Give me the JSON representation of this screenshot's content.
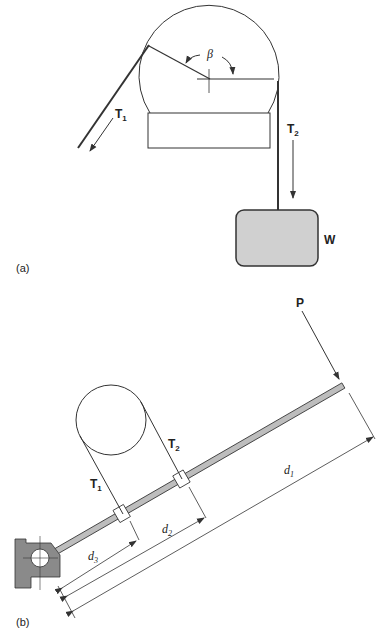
{
  "diagram": {
    "part_a": {
      "caption": "(a)",
      "angle_label": "β",
      "tension_1": {
        "base": "T",
        "sub": "1"
      },
      "tension_2": {
        "base": "T",
        "sub": "2"
      },
      "weight_label": "W",
      "colors": {
        "weight_fill": "#d0d0d0",
        "stroke": "#333333"
      }
    },
    "part_b": {
      "caption": "(b)",
      "load_label": "P",
      "tension_1": {
        "base": "T",
        "sub": "1"
      },
      "tension_2": {
        "base": "T",
        "sub": "2"
      },
      "dim_1": {
        "base": "d",
        "sub": "1"
      },
      "dim_2": {
        "base": "d",
        "sub": "2"
      },
      "dim_3": {
        "base": "d",
        "sub": "3"
      },
      "colors": {
        "bar_fill": "#bdbdbd",
        "pivot_fill": "#8a8a8a",
        "stroke": "#333333"
      }
    }
  }
}
